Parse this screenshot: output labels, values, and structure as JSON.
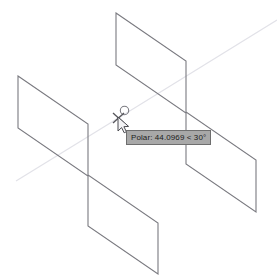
{
  "app": {
    "name": "CAD Drawing Area",
    "background_color": "#ffffff"
  },
  "canvas": {
    "width": 277,
    "height": 275,
    "view": "isometric-3d-wireframe"
  },
  "tooltip": {
    "name": "polar-tracking-tooltip",
    "label": "Polar: 44.0969 < 30°",
    "prefix": "Polar:",
    "distance": "44.0969",
    "separator": "<",
    "angle": "30°",
    "background_color": "#a8a8a8",
    "border_color": "#6e6e6e",
    "text_color": "#1c1c1c",
    "x": 126,
    "y": 130
  },
  "cursor": {
    "name": "crosshair-pointer",
    "x": 120,
    "y": 117,
    "snap_marker": "endpoint-circle",
    "snap_marker_x": 124,
    "snap_marker_y": 110
  },
  "geometry": {
    "line_color": "#7a7a80",
    "tracking_line_color": "#e2e2e8",
    "shapes": [
      {
        "name": "upper-right-wall-face",
        "type": "polyline",
        "closed": true,
        "points": "116,13 186,61 186,112 256,160 256,212 186,164 186,113 116,65"
      },
      {
        "name": "lower-left-wall-face",
        "type": "polyline",
        "closed": true,
        "points": "18,76 88,124 88,175 158,223 158,274 88,226 88,176 18,128"
      }
    ],
    "tracking_lines": [
      {
        "name": "polar-tracking-ray-upper-right",
        "from": "120,117",
        "to": "277,20"
      },
      {
        "name": "polar-tracking-ray-lower-left",
        "from": "120,117",
        "to": "16,181"
      }
    ]
  }
}
